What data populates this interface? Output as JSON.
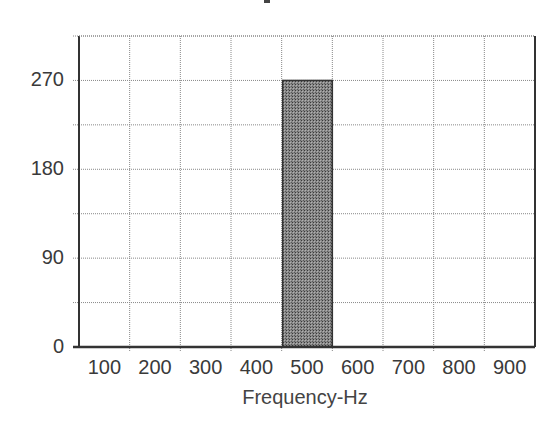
{
  "chart_data": {
    "type": "bar",
    "title": "",
    "xlabel": "Frequency-Hz",
    "ylabel": "",
    "categories": [
      "100",
      "200",
      "300",
      "400",
      "500",
      "600",
      "700",
      "800",
      "900"
    ],
    "values": [
      0,
      0,
      0,
      0,
      270,
      0,
      0,
      0,
      0
    ],
    "y_ticks": [
      0,
      90,
      180,
      270
    ],
    "ylim": [
      0,
      315
    ],
    "grid": true,
    "grid_y_step": 45,
    "legend": null,
    "bar_color": "#7a7a7a",
    "bar_edge_color": "#333333",
    "bar_pattern": "stipple"
  },
  "axis": {
    "x_title": "Frequency-Hz",
    "y_tick_labels": [
      "270",
      "180",
      "90",
      "0"
    ],
    "x_tick_labels": [
      "100",
      "200",
      "300",
      "400",
      "500",
      "600",
      "700",
      "800",
      "900"
    ]
  }
}
